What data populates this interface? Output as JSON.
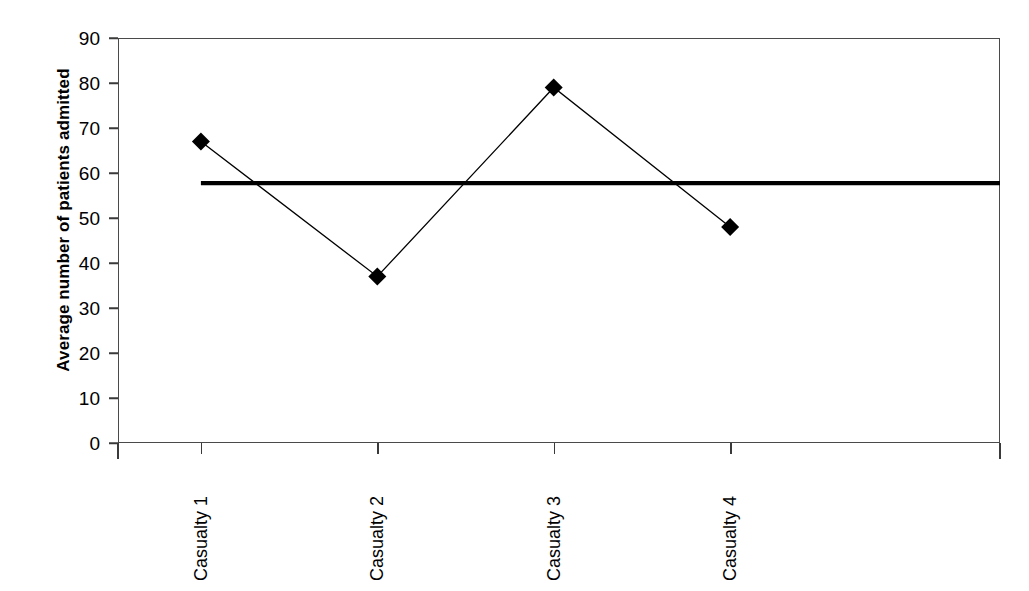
{
  "chart_data": {
    "type": "line",
    "title": "",
    "subtitle": "",
    "xlabel": "",
    "ylabel": "Average number of patients admitted",
    "categories": [
      "Casualty 1",
      "Casualty 2",
      "Casualty 3",
      "Casualty 4"
    ],
    "series": [
      {
        "name": "Average number of patients admitted",
        "values": [
          67,
          37,
          79,
          48
        ],
        "marker": "filled-diamond",
        "color": "#000000"
      }
    ],
    "reference_line": {
      "name": "overall mean",
      "value": 57.75,
      "orientation": "horizontal",
      "style": "thick-solid",
      "color": "#000000"
    },
    "ylim": [
      0,
      90
    ],
    "yticks": [
      0,
      10,
      20,
      30,
      40,
      50,
      60,
      70,
      80,
      90
    ],
    "ytick_labels": [
      "0",
      "10",
      "20",
      "30",
      "40",
      "50",
      "60",
      "70",
      "80",
      "90"
    ],
    "grid": false,
    "legend": "none",
    "xtick_label_rotation": -90,
    "frame": "box"
  },
  "axes": {
    "y_title": "Average number of patients admitted"
  },
  "colors": {
    "axis": "#3a3a3a",
    "frame": "#4a4a4a",
    "data": "#000000",
    "reference": "#000000",
    "background": "#ffffff"
  }
}
